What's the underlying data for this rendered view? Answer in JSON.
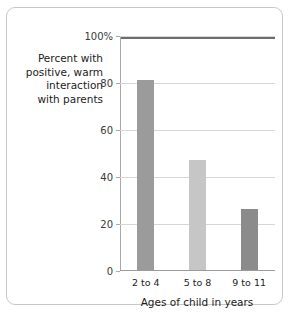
{
  "chart_data": {
    "type": "bar",
    "title": "",
    "subtitle": "",
    "xlabel": "Ages of child in years",
    "ylabel": "Percent with\npositive, warm\ninteraction\nwith parents",
    "categories": [
      "2 to 4",
      "5 to 8",
      "9 to 11"
    ],
    "values": [
      81,
      47,
      26
    ],
    "series": [
      {
        "name": "Percent with positive, warm interaction with parents",
        "values": [
          81,
          47,
          26
        ]
      }
    ],
    "ylim": [
      0,
      100
    ],
    "yticks": [
      0,
      20,
      40,
      60,
      80,
      100
    ],
    "ytick_labels": [
      "0",
      "20",
      "40",
      "60",
      "80",
      "100%"
    ],
    "grid": "horizontal",
    "legend": "none",
    "bar_colors": [
      "#9b9b9b",
      "#c6c6c6",
      "#8b8b8b"
    ],
    "gridline_color": "#d6d6d6",
    "axis_color": "#a9a9a9",
    "frame_top_color": "#6e6e6e",
    "border_color": "#c8c8c8",
    "background": "#ffffff",
    "text_color": "#1c1c1c"
  }
}
